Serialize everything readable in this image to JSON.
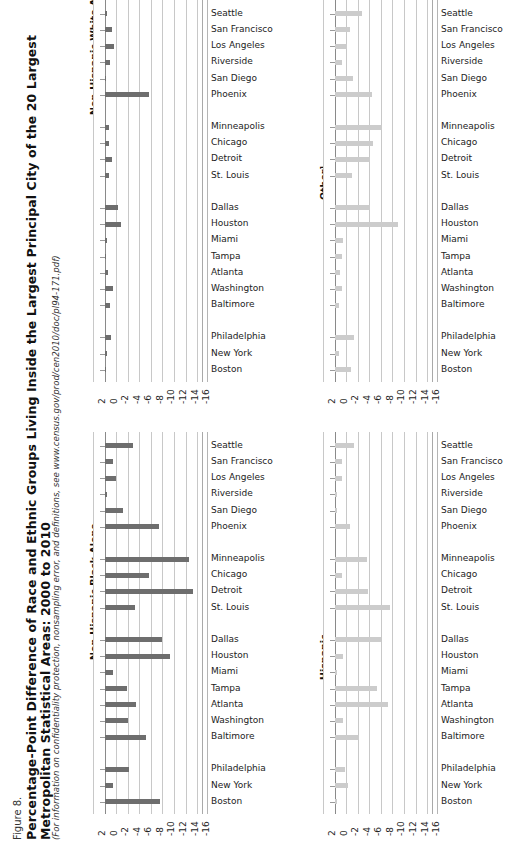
{
  "figure": {
    "number": "Figure 8.",
    "title_line1": "Percentage-Point Difference of Race and Ethnic Groups Living Inside the Largest Principal City of the 20 Largest",
    "title_line2": "Metropolitan Statistical Areas: 2000 to 2010",
    "note": "(For information on confidentiality protection, nonsampling error, and definitions, see www.census.gov/prod/cen2010/doc/pl94-171.pdf)"
  },
  "axis": {
    "ticks": [
      "2",
      "0",
      "-2",
      "-4",
      "-6",
      "-8",
      "-10",
      "-12",
      "-14",
      "-16"
    ],
    "min": -17,
    "max": 2
  },
  "cities": [
    "Seattle",
    "San Francisco",
    "Los Angeles",
    "Riverside",
    "San Diego",
    "Phoenix",
    "Minneapolis",
    "Chicago",
    "Detroit",
    "St. Louis",
    "Dallas",
    "Houston",
    "Miami",
    "Tampa",
    "Atlanta",
    "Washington",
    "Baltimore",
    "Philadelphia",
    "New York",
    "Boston"
  ],
  "group_breaks": [
    6,
    10,
    17
  ],
  "chart_data": [
    {
      "type": "bar",
      "title": "Non-Hispanic White Alone",
      "panel": "top-left",
      "color": "#6e6e6e",
      "xlabel": "",
      "ylabel": "",
      "xlim": [
        -17,
        2
      ],
      "grid": true,
      "categories": [
        "Seattle",
        "San Francisco",
        "Los Angeles",
        "Riverside",
        "San Diego",
        "Phoenix",
        "Minneapolis",
        "Chicago",
        "Detroit",
        "St. Louis",
        "Dallas",
        "Houston",
        "Miami",
        "Tampa",
        "Atlanta",
        "Washington",
        "Baltimore",
        "Philadelphia",
        "New York",
        "Boston"
      ],
      "values": [
        -0.4,
        -1.3,
        -1.6,
        -0.9,
        -0.3,
        -7.7,
        -0.8,
        -0.7,
        -1.2,
        -0.8,
        -2.3,
        -2.9,
        -0.5,
        -0.2,
        -0.6,
        -1.5,
        -1.0,
        -1.1,
        -0.4,
        -0.3
      ]
    },
    {
      "type": "bar",
      "title": "Other¹",
      "panel": "top-right",
      "color": "#cccccc",
      "xlabel": "",
      "ylabel": "",
      "xlim": [
        -17,
        2
      ],
      "grid": true,
      "categories": [
        "Seattle",
        "San Francisco",
        "Los Angeles",
        "Riverside",
        "San Diego",
        "Phoenix",
        "Minneapolis",
        "Chicago",
        "Detroit",
        "St. Louis",
        "Dallas",
        "Houston",
        "Miami",
        "Tampa",
        "Atlanta",
        "Washington",
        "Baltimore",
        "Philadelphia",
        "New York",
        "Boston"
      ],
      "values": [
        -4.7,
        -2.6,
        -2.1,
        -1.2,
        -3.2,
        -6.4,
        -8.2,
        -6.6,
        -6.2,
        -3.0,
        -6.2,
        -11.0,
        -1.4,
        -1.3,
        -0.9,
        -1.2,
        -0.8,
        -3.4,
        -0.7,
        -2.8
      ]
    },
    {
      "type": "bar",
      "title": "Non-Hispanic Black Alone",
      "panel": "bottom-left",
      "color": "#6e6e6e",
      "xlabel": "",
      "ylabel": "",
      "xlim": [
        -17,
        2
      ],
      "grid": true,
      "categories": [
        "Seattle",
        "San Francisco",
        "Los Angeles",
        "Riverside",
        "San Diego",
        "Phoenix",
        "Minneapolis",
        "Chicago",
        "Detroit",
        "St. Louis",
        "Dallas",
        "Houston",
        "Miami",
        "Tampa",
        "Atlanta",
        "Washington",
        "Baltimore",
        "Philadelphia",
        "New York",
        "Boston"
      ],
      "values": [
        -4.9,
        -1.4,
        -2.0,
        -0.5,
        -3.1,
        -9.4,
        -14.6,
        -7.7,
        -15.2,
        -5.3,
        -9.9,
        -11.3,
        -1.4,
        -3.8,
        -5.4,
        -4.0,
        -7.1,
        -4.3,
        -1.4,
        -9.5
      ]
    },
    {
      "type": "bar",
      "title": "Hispanic",
      "panel": "bottom-right",
      "color": "#cccccc",
      "xlabel": "",
      "ylabel": "",
      "xlim": [
        -17,
        2
      ],
      "grid": true,
      "categories": [
        "Seattle",
        "San Francisco",
        "Los Angeles",
        "Riverside",
        "San Diego",
        "Phoenix",
        "Minneapolis",
        "Chicago",
        "Detroit",
        "St. Louis",
        "Dallas",
        "Houston",
        "Miami",
        "Tampa",
        "Atlanta",
        "Washington",
        "Baltimore",
        "Philadelphia",
        "New York",
        "Boston"
      ],
      "values": [
        -3.4,
        -1.2,
        -1.2,
        -0.5,
        -0.5,
        -2.7,
        -5.6,
        -1.3,
        -5.7,
        -9.6,
        -8.0,
        -1.5,
        -0.5,
        -7.3,
        -9.2,
        -1.4,
        -4.3,
        -1.8,
        -2.4,
        -0.4
      ]
    }
  ]
}
